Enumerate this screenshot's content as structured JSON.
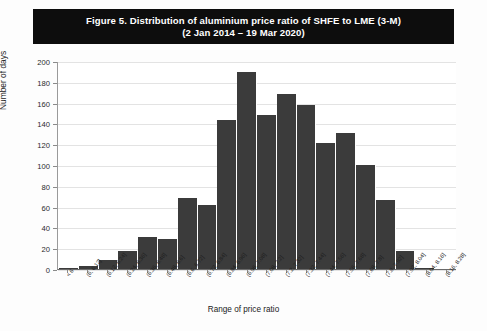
{
  "title": {
    "line1": "Figure 5.  Distribution of aluminium price ratio of SHFE to LME (3-M)",
    "line2": "(2 Jan 2014 – 19 Mar 2020)"
  },
  "axis": {
    "ylabel": "Number of days",
    "xlabel": "Range of price ratio",
    "yticks": [
      "0",
      "20",
      "40",
      "60",
      "80",
      "100",
      "120",
      "140",
      "160",
      "180",
      "200"
    ]
  },
  "colors": {
    "bar": "#3b3b3b",
    "title_bg": "#0d0d0d",
    "title_fg": "#ffffff",
    "grid": "#e3e3e3",
    "plot_bg": "#ffffff"
  },
  "chart_data": {
    "type": "bar",
    "title": "Figure 5.  Distribution of aluminium price ratio of SHFE to LME (3-M) (2 Jan 2014 – 19 Mar 2020)",
    "xlabel": "Range of price ratio",
    "ylabel": "Number of days",
    "ylim": [
      0,
      200
    ],
    "ytick_step": 20,
    "grid": true,
    "legend": false,
    "categories": [
      "< 6",
      "(6, 6.12]",
      "(6.12, 6.24]",
      "(6.24, 6.36]",
      "(6.36, 6.48]",
      "(6.48, 6.6]",
      "(6.6, 6.72]",
      "(6.72, 6.84]",
      "(6.84, 6.96]",
      "(6.96, 7.08]",
      "(7.08, 7.2]",
      "(7.2, 7.32]",
      "(7.32, 7.44]",
      "(7.44, 7.56]",
      "(7.56, 7.68]",
      "(7.68, 7.8]",
      "(7.8, 7.92]",
      "(7.92, 8.04]",
      "(8.04, 8.16]",
      "(8.16, 8.28]"
    ],
    "values": [
      1,
      3,
      9,
      17,
      31,
      29,
      68,
      62,
      143,
      189,
      148,
      168,
      158,
      121,
      131,
      100,
      66,
      17,
      1,
      0
    ]
  }
}
